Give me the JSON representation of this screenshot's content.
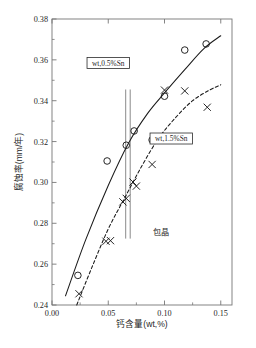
{
  "chart_data": {
    "type": "scatter",
    "title": "",
    "xlabel": "钙含量(wt,%)",
    "ylabel": "腐蚀率(mm/年)",
    "xlim": [
      0.0,
      0.16
    ],
    "ylim": [
      0.24,
      0.38
    ],
    "xticks": [
      0.0,
      0.05,
      0.1,
      0.15
    ],
    "xtick_labels": [
      "0.00",
      "0.05",
      "0.10",
      "0.15"
    ],
    "yticks": [
      0.24,
      0.26,
      0.28,
      0.3,
      0.32,
      0.34,
      0.36,
      0.38
    ],
    "ytick_labels": [
      "0.24",
      "0.26",
      "0.28",
      "0.30",
      "0.32",
      "0.34",
      "0.36",
      "0.38"
    ],
    "minor_xticks": [
      0.025,
      0.075,
      0.125
    ],
    "minor_yticks": [
      0.25,
      0.27,
      0.29,
      0.31,
      0.33,
      0.35,
      0.37
    ],
    "grid": false,
    "legend_position": "inside-plot",
    "series": [
      {
        "name": "wt,0.5%Sn",
        "marker": "circle",
        "line_style": "solid",
        "color": "#1a1a1a",
        "points": [
          {
            "x": 0.023,
            "y": 0.2545
          },
          {
            "x": 0.049,
            "y": 0.3105
          },
          {
            "x": 0.066,
            "y": 0.3182
          },
          {
            "x": 0.073,
            "y": 0.3252
          },
          {
            "x": 0.089,
            "y": 0.3208
          },
          {
            "x": 0.1,
            "y": 0.3422
          },
          {
            "x": 0.118,
            "y": 0.3648
          },
          {
            "x": 0.137,
            "y": 0.3678
          }
        ],
        "curve": [
          {
            "x": 0.012,
            "y": 0.2445
          },
          {
            "x": 0.03,
            "y": 0.272
          },
          {
            "x": 0.05,
            "y": 0.2985
          },
          {
            "x": 0.068,
            "y": 0.3192
          },
          {
            "x": 0.085,
            "y": 0.3338
          },
          {
            "x": 0.1,
            "y": 0.3438
          },
          {
            "x": 0.118,
            "y": 0.3552
          },
          {
            "x": 0.135,
            "y": 0.3655
          },
          {
            "x": 0.15,
            "y": 0.3718
          }
        ]
      },
      {
        "name": "wt,1.5%Sn",
        "marker": "cross",
        "line_style": "dashed",
        "color": "#1a1a1a",
        "points": [
          {
            "x": 0.024,
            "y": 0.2455
          },
          {
            "x": 0.048,
            "y": 0.2712
          },
          {
            "x": 0.052,
            "y": 0.2715
          },
          {
            "x": 0.063,
            "y": 0.2905
          },
          {
            "x": 0.066,
            "y": 0.2922
          },
          {
            "x": 0.072,
            "y": 0.3002
          },
          {
            "x": 0.075,
            "y": 0.2982
          },
          {
            "x": 0.089,
            "y": 0.3088
          },
          {
            "x": 0.1,
            "y": 0.3452
          },
          {
            "x": 0.118,
            "y": 0.3448
          },
          {
            "x": 0.138,
            "y": 0.3368
          }
        ],
        "curve": [
          {
            "x": 0.022,
            "y": 0.24
          },
          {
            "x": 0.035,
            "y": 0.2578
          },
          {
            "x": 0.05,
            "y": 0.2772
          },
          {
            "x": 0.065,
            "y": 0.2928
          },
          {
            "x": 0.08,
            "y": 0.3082
          },
          {
            "x": 0.095,
            "y": 0.3218
          },
          {
            "x": 0.11,
            "y": 0.3318
          },
          {
            "x": 0.125,
            "y": 0.34
          },
          {
            "x": 0.14,
            "y": 0.3452
          },
          {
            "x": 0.15,
            "y": 0.3478
          }
        ]
      }
    ],
    "annotations": [
      {
        "name": "peritectic-label",
        "text": "包晶",
        "x": 0.097,
        "y": 0.2745
      },
      {
        "name": "peritectic-band-left",
        "x": 0.0655
      },
      {
        "name": "peritectic-band-right",
        "x": 0.0695
      }
    ],
    "legend_boxes": [
      {
        "name": "legend-box-series-1",
        "text": "wt,0.5%Sn",
        "x": 0.05,
        "y": 0.3585
      },
      {
        "name": "legend-box-series-2",
        "text": "wt,1.5%Sn",
        "x": 0.106,
        "y": 0.3215
      }
    ]
  },
  "figure": {
    "caption": ""
  }
}
